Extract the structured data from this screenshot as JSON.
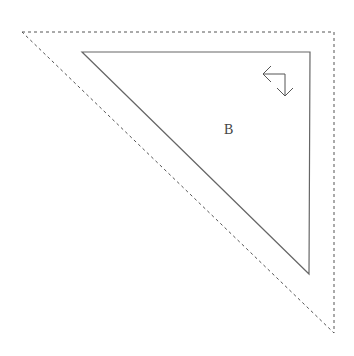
{
  "diagram": {
    "outer_triangle": {
      "style": "dashed",
      "stroke": "#555555",
      "points": [
        [
          22,
          32
        ],
        [
          334,
          32
        ],
        [
          334,
          333
        ]
      ]
    },
    "inner_triangle": {
      "style": "solid",
      "stroke": "#666666",
      "points": [
        [
          82,
          52
        ],
        [
          310,
          52
        ],
        [
          309,
          274
        ]
      ]
    },
    "label": {
      "text": "B",
      "x": 224,
      "y": 134
    },
    "icon": {
      "name": "rotate-arrow-icon",
      "stroke": "#555555"
    }
  }
}
